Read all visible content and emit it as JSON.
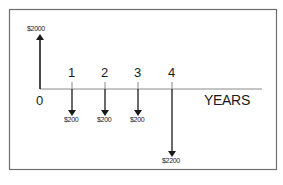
{
  "diagram": {
    "type": "cash-flow-diagram",
    "axis_label": "YEARS",
    "periods": [
      "0",
      "1",
      "2",
      "3",
      "4"
    ],
    "flows": [
      {
        "period": "0",
        "direction": "up",
        "label": "$2000",
        "amount": 2000
      },
      {
        "period": "1",
        "direction": "down",
        "label": "$200",
        "amount": 200
      },
      {
        "period": "2",
        "direction": "down",
        "label": "$200",
        "amount": 200
      },
      {
        "period": "3",
        "direction": "down",
        "label": "$200",
        "amount": 200
      },
      {
        "period": "4",
        "direction": "down",
        "label": "$2200",
        "amount": 2200
      }
    ],
    "colors": {
      "line": "#1a1a1a",
      "axis": "#8a8a8a",
      "frame": "#6e6e6e",
      "background": "#ffffff"
    }
  }
}
